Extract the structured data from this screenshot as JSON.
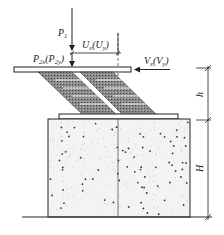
{
  "diagram": {
    "labels": {
      "p1": {
        "main": "P",
        "sub": "1"
      },
      "p2": {
        "main": "P",
        "sub": "2x",
        "paren_main": "P",
        "paren_sub": "2y"
      },
      "u": {
        "main": "U",
        "sub": "x",
        "paren_main": "U",
        "paren_sub": "y"
      },
      "v": {
        "main": "V",
        "sub": "x",
        "paren_main": "V",
        "paren_sub": "y"
      },
      "h_small": "h",
      "h_large": "H"
    },
    "components": [
      "top-plate",
      "laminated-bearing-left",
      "laminated-bearing-right",
      "bottom-plate",
      "concrete-pier",
      "ground-line",
      "dimension-line"
    ],
    "colors": {
      "line": "#222222",
      "hatch": "#555555",
      "concrete_speck": "#333333"
    }
  }
}
